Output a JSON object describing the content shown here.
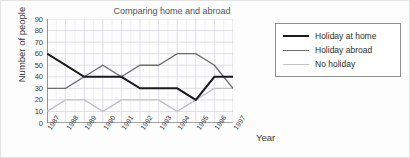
{
  "chart_data": {
    "type": "line",
    "title": "Comparing home and abroad",
    "xlabel": "Year",
    "ylabel": "Number of people",
    "categories": [
      "1987",
      "1988",
      "1989",
      "1990",
      "1991",
      "1992",
      "1993",
      "1994",
      "1995",
      "1996",
      "1997"
    ],
    "x": [
      1987,
      1988,
      1989,
      1990,
      1991,
      1992,
      1993,
      1994,
      1995,
      1996,
      1997
    ],
    "ylim": [
      0,
      90
    ],
    "ytick_labels": [
      "0",
      "10",
      "20",
      "30",
      "40",
      "50",
      "60",
      "70",
      "80",
      "90"
    ],
    "ytick_values": [
      0,
      10,
      20,
      30,
      40,
      50,
      60,
      70,
      80,
      90
    ],
    "grid": true,
    "legend_position": "right",
    "series": [
      {
        "name": "Holiday at home",
        "color": "#1a1a1a",
        "width": 2.0,
        "values": [
          60,
          50,
          40,
          40,
          40,
          30,
          30,
          30,
          20,
          40,
          40
        ]
      },
      {
        "name": "Holiday abroad",
        "color": "#6e6e6e",
        "width": 1.4,
        "values": [
          30,
          30,
          40,
          50,
          40,
          50,
          50,
          60,
          60,
          50,
          30
        ]
      },
      {
        "name": "No holiday",
        "color": "#c3c3c3",
        "width": 1.4,
        "values": [
          10,
          20,
          20,
          10,
          20,
          20,
          20,
          10,
          20,
          30,
          30
        ]
      }
    ]
  },
  "legend": {
    "items": [
      {
        "label": "Holiday at home"
      },
      {
        "label": "Holiday abroad"
      },
      {
        "label": "No holiday"
      }
    ]
  },
  "colors": {
    "axis": "#5a5a5a",
    "grid_major": "#d3d3e0",
    "grid_minor": "#e9e9f2",
    "background": "#fdfdfd",
    "legend_border": "#8e8e8e",
    "text": "#3b3b3b"
  }
}
